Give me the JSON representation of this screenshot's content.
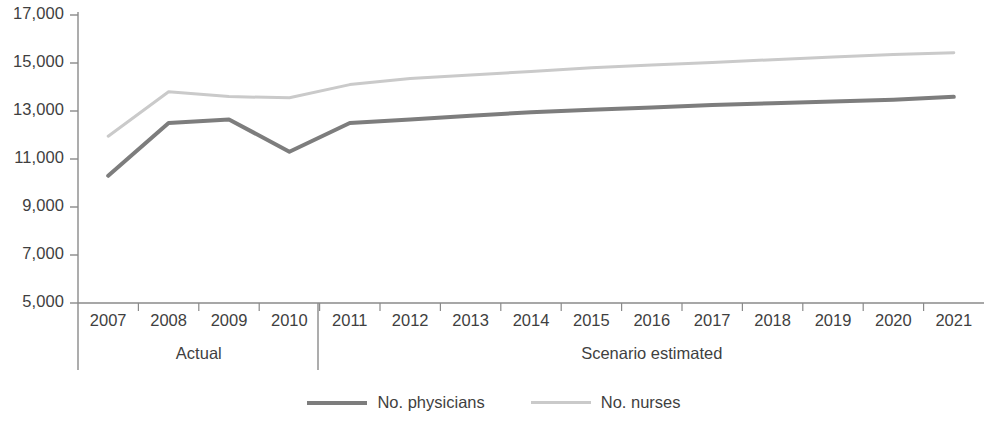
{
  "chart_data": {
    "type": "line",
    "title": "",
    "xlabel": "",
    "ylabel": "",
    "x": [
      "2007",
      "2008",
      "2009",
      "2010",
      "2011",
      "2012",
      "2013",
      "2014",
      "2015",
      "2016",
      "2017",
      "2018",
      "2019",
      "2020",
      "2021"
    ],
    "categories": [
      "2007",
      "2008",
      "2009",
      "2010",
      "2011",
      "2012",
      "2013",
      "2014",
      "2015",
      "2016",
      "2017",
      "2018",
      "2019",
      "2020",
      "2021"
    ],
    "ylim": [
      5000,
      17000
    ],
    "ytick_labels": [
      "17,000",
      "15,000",
      "13,000",
      "11,000",
      "9,000",
      "7,000",
      "5,000"
    ],
    "ytick_values": [
      17000,
      15000,
      13000,
      11000,
      9000,
      7000,
      5000
    ],
    "grid": false,
    "legend_position": "bottom-center",
    "series": [
      {
        "name": "No. physicians",
        "color": "#7d7d7d",
        "values": [
          10300,
          12500,
          12650,
          11300,
          12500,
          12650,
          12800,
          12950,
          13050,
          13150,
          13250,
          13320,
          13400,
          13470,
          13590
        ]
      },
      {
        "name": "No. nurses",
        "color": "#cacaca",
        "values": [
          11950,
          13800,
          13600,
          13550,
          14100,
          14350,
          14500,
          14650,
          14800,
          14920,
          15020,
          15140,
          15250,
          15350,
          15430
        ]
      }
    ],
    "period_bands": [
      {
        "label": "Actual",
        "from": "2007",
        "to": "2010"
      },
      {
        "label": "Scenario estimated",
        "from": "2011",
        "to": "2021"
      }
    ],
    "annotations": []
  }
}
